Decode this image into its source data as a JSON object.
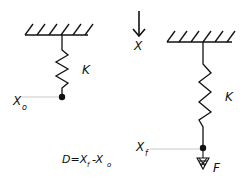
{
  "diagram": {
    "left_spring": {
      "spring_label": "K",
      "position_label": "X",
      "position_subscript": "o"
    },
    "axis": {
      "label": "X"
    },
    "right_spring": {
      "spring_label": "K",
      "position_label": "X",
      "position_subscript": "f",
      "force_label": "F"
    },
    "formula": {
      "prefix": "D=X",
      "sub1": "f",
      "middle": "-X",
      "sub2": "o"
    },
    "colors": {
      "stroke": "#111111",
      "guide": "#bbbbbb",
      "background": "#ffffff"
    }
  }
}
